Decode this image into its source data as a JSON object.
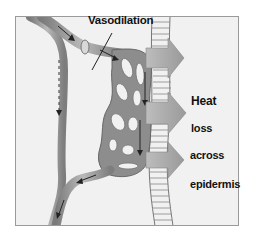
{
  "diagram": {
    "type": "physiology-illustration",
    "labels": {
      "vasodilation": "Vasodilation",
      "heat": "Heat",
      "loss": "loss",
      "across": "across",
      "epidermis": "epidermis"
    },
    "elements": [
      {
        "id": "skin-layer",
        "description": "Ladder-like epidermis strip running vertically"
      },
      {
        "id": "dilated-capillary-bed",
        "description": "Dilated vessel network adjacent to epidermis"
      },
      {
        "id": "heat-arrows",
        "count": 3,
        "description": "Gray arrows pointing right through epidermis"
      },
      {
        "id": "shunt-vessel",
        "description": "Left bypass vessel with dashed flow arrow"
      },
      {
        "id": "precapillary-sphincter",
        "description": "Relaxed ring on arteriole entering network"
      }
    ],
    "colors": {
      "background": "#f1f1f1",
      "vessel": "#8a8a8a",
      "vessel_highlight": "#c8c8c8",
      "arrow": "#a9a9a9",
      "frame": "#9a9a9a"
    }
  }
}
